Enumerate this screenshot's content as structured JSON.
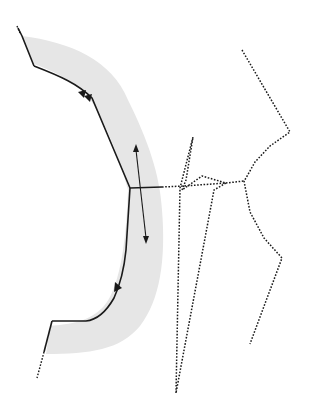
{
  "diagram": {
    "type": "sewing-pattern",
    "colors": {
      "background": "#ffffff",
      "shaded_region": "#e6e6e6",
      "line": "#1a1a1a"
    },
    "shaded_band": {
      "label": "facing-band"
    },
    "solid_outline": {
      "label": "seam-line"
    },
    "notches": [
      {
        "label": "double-notch",
        "count": 2,
        "x": 86,
        "y": 94
      },
      {
        "label": "single-notch",
        "count": 1,
        "x": 118,
        "y": 286
      }
    ],
    "grainline": {
      "label": "grainline-arrow",
      "start": [
        136,
        146
      ],
      "end": [
        146,
        242
      ]
    },
    "dotted_lines": [
      {
        "label": "construction-line-1"
      },
      {
        "label": "construction-line-2"
      },
      {
        "label": "construction-line-3"
      },
      {
        "label": "construction-line-4"
      }
    ]
  }
}
